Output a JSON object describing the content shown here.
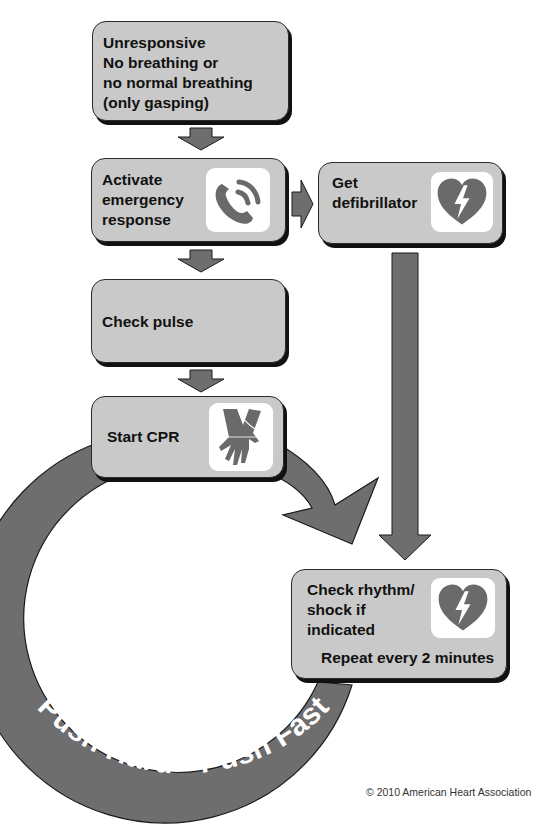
{
  "colors": {
    "box_fill": "#c9c9c9",
    "arrow_fill": "#6e6e6e",
    "icon_fill": "#6a6a6a",
    "ring_text": "#ffffff"
  },
  "steps": [
    {
      "id": "unresponsive",
      "label": "Unresponsive\nNo breathing or\nno normal breathing\n(only gasping)",
      "icon": null
    },
    {
      "id": "activate",
      "label": "Activate\nemergency\nresponse",
      "icon": "phone-icon"
    },
    {
      "id": "defibrillator",
      "label": "Get\ndefibrillator",
      "icon": "heart-lightning-icon"
    },
    {
      "id": "check-pulse",
      "label": "Check pulse",
      "icon": null
    },
    {
      "id": "start-cpr",
      "label": "Start CPR",
      "icon": "hands-compression-icon"
    },
    {
      "id": "check-rhythm",
      "label": "Check rhythm/\nshock if\nindicated",
      "sublabel": "Repeat every 2 minutes",
      "icon": "heart-lightning-icon"
    }
  ],
  "ring_text": "Push Hard • Push Fast",
  "copyright": "© 2010 American Heart Association"
}
